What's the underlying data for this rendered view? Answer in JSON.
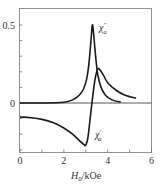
{
  "chart_data": {
    "type": "line",
    "title": "",
    "xlabel": "H0/kOe",
    "xlabel_parts": {
      "main": "H",
      "sub": "0",
      "unit": "/kOe"
    },
    "ylabel": "",
    "xlim": [
      0,
      6
    ],
    "ylim": [
      -0.32,
      0.6
    ],
    "x_ticks": [
      0,
      2,
      4,
      6
    ],
    "x_minor_step": 1,
    "y_ticks": [
      0,
      0.5
    ],
    "y_tick_labels": [
      "0",
      "0.5"
    ],
    "y_minor_step": 0.1,
    "grid": false,
    "zero_line": true,
    "legend": "inline annotations",
    "series": [
      {
        "name": "χa″",
        "label_main": "χ",
        "label_sub": "a",
        "label_sup": "″",
        "x": [
          0,
          1.0,
          2.0,
          2.4,
          2.7,
          2.9,
          3.05,
          3.15,
          3.25,
          3.3,
          3.35,
          3.45,
          3.55,
          3.7,
          3.9,
          4.2,
          4.6
        ],
        "y": [
          0,
          0.0,
          0.005,
          0.02,
          0.05,
          0.09,
          0.16,
          0.26,
          0.42,
          0.5,
          0.46,
          0.3,
          0.18,
          0.1,
          0.05,
          0.02,
          0.005
        ]
      },
      {
        "name": "χa′",
        "label_main": "χ",
        "label_sub": "a",
        "label_sup": "′",
        "x": [
          0,
          0.5,
          1.0,
          1.5,
          2.0,
          2.4,
          2.7,
          2.9,
          3.0,
          3.1,
          3.2,
          3.3,
          3.4,
          3.5,
          3.6,
          3.8,
          4.0,
          4.4,
          4.8,
          5.3
        ],
        "y": [
          -0.09,
          -0.095,
          -0.105,
          -0.125,
          -0.16,
          -0.2,
          -0.24,
          -0.265,
          -0.27,
          -0.22,
          -0.1,
          0.02,
          0.13,
          0.2,
          0.22,
          0.18,
          0.13,
          0.08,
          0.05,
          0.03
        ]
      }
    ],
    "annotations": [
      {
        "text": "χa″",
        "near_x": 3.6,
        "near_y": 0.48
      },
      {
        "text": "χa′",
        "near_x": 3.3,
        "near_y": -0.2
      }
    ]
  },
  "colors": {
    "curve": "#1a1a1a",
    "axis": "#555555",
    "zero_line": "#444444",
    "text": "#333333"
  }
}
